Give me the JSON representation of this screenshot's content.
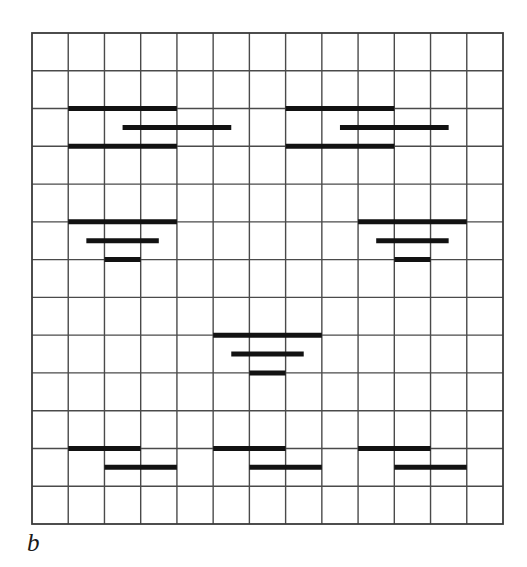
{
  "figure": {
    "label": "b",
    "label_style": "italic-serif-lowercase",
    "background_color": "#ffffff",
    "grid_color": "#4a4a4a",
    "border_color": "#3a3a3a",
    "bar_color": "#121212"
  },
  "chart_data": {
    "type": "heatmap",
    "title": "",
    "subtitle": "",
    "xlabel": "",
    "ylabel": "",
    "annotations": [
      "b"
    ],
    "legend": [],
    "legend_position": "none",
    "grid": true,
    "grid_cols": 13,
    "grid_rows": 13,
    "xlim": [
      0,
      13
    ],
    "ylim": [
      0,
      13
    ],
    "x_tick_labels": [],
    "y_tick_labels": [],
    "plot_box": {
      "x": 32,
      "y": 33,
      "width": 471,
      "height": 491
    },
    "cell_width": 36.23,
    "cell_height": 37.77,
    "bar_thickness_px": 5,
    "clusters": [
      {
        "name": "top-left",
        "bars": [
          {
            "x_start": 1.0,
            "x_end": 4.0,
            "y": 2.0
          },
          {
            "x_start": 2.5,
            "x_end": 5.5,
            "y": 2.5
          },
          {
            "x_start": 1.0,
            "x_end": 4.0,
            "y": 3.0
          }
        ]
      },
      {
        "name": "top-right",
        "bars": [
          {
            "x_start": 7.0,
            "x_end": 10.0,
            "y": 2.0
          },
          {
            "x_start": 8.5,
            "x_end": 11.5,
            "y": 2.5
          },
          {
            "x_start": 7.0,
            "x_end": 10.0,
            "y": 3.0
          }
        ]
      },
      {
        "name": "middle-left",
        "bars": [
          {
            "x_start": 1.0,
            "x_end": 4.0,
            "y": 5.0
          },
          {
            "x_start": 1.5,
            "x_end": 3.5,
            "y": 5.5
          },
          {
            "x_start": 2.0,
            "x_end": 3.0,
            "y": 6.0
          }
        ]
      },
      {
        "name": "middle-right",
        "bars": [
          {
            "x_start": 9.0,
            "x_end": 12.0,
            "y": 5.0
          },
          {
            "x_start": 9.5,
            "x_end": 11.5,
            "y": 5.5
          },
          {
            "x_start": 10.0,
            "x_end": 11.0,
            "y": 6.0
          }
        ]
      },
      {
        "name": "center",
        "bars": [
          {
            "x_start": 5.0,
            "x_end": 8.0,
            "y": 8.0
          },
          {
            "x_start": 5.5,
            "x_end": 7.5,
            "y": 8.5
          },
          {
            "x_start": 6.0,
            "x_end": 7.0,
            "y": 9.0
          }
        ]
      },
      {
        "name": "bottom-left",
        "bars": [
          {
            "x_start": 1.0,
            "x_end": 3.0,
            "y": 11.0
          },
          {
            "x_start": 2.0,
            "x_end": 4.0,
            "y": 11.5
          }
        ]
      },
      {
        "name": "bottom-center",
        "bars": [
          {
            "x_start": 5.0,
            "x_end": 7.0,
            "y": 11.0
          },
          {
            "x_start": 6.0,
            "x_end": 8.0,
            "y": 11.5
          }
        ]
      },
      {
        "name": "bottom-right",
        "bars": [
          {
            "x_start": 9.0,
            "x_end": 11.0,
            "y": 11.0
          },
          {
            "x_start": 10.0,
            "x_end": 12.0,
            "y": 11.5
          }
        ]
      }
    ]
  }
}
